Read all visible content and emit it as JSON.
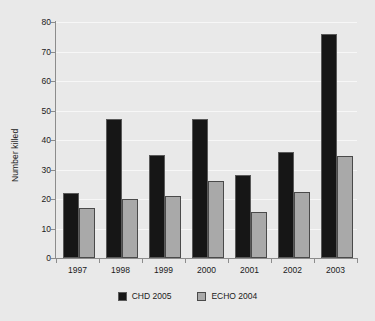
{
  "chart_data": {
    "type": "bar",
    "title": "",
    "subtitle": "",
    "xlabel": "",
    "ylabel": "Number killed",
    "categories": [
      "1997",
      "1998",
      "1999",
      "2000",
      "2001",
      "2002",
      "2003"
    ],
    "series": [
      {
        "name": "CHD 2005",
        "color": "#161616",
        "values": [
          22,
          47,
          35,
          47,
          28,
          36,
          76
        ]
      },
      {
        "name": "ECHO 2004",
        "color": "#a9a9a9",
        "values": [
          17,
          20,
          21,
          26,
          15.5,
          22.5,
          34.5
        ]
      }
    ],
    "ylim": [
      0,
      80
    ],
    "ytick_labels": [
      "0",
      "10",
      "20",
      "30",
      "40",
      "50",
      "60",
      "70",
      "80"
    ],
    "ytick_values": [
      0,
      10,
      20,
      30,
      40,
      50,
      60,
      70,
      80
    ],
    "grid": true,
    "grid_axis": "y",
    "legend_position": "bottom",
    "background_color": "#e9e9e9",
    "gridline_color": "#f7f7f7",
    "axis_color": "#8c8c8c",
    "text_color": "#1a1a1a"
  }
}
